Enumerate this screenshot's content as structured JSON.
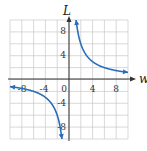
{
  "chart_data": {
    "type": "line",
    "title": "",
    "xlabel": "w",
    "ylabel": "L",
    "xlim": [
      -10,
      10
    ],
    "ylim": [
      -10,
      10
    ],
    "grid": true,
    "grid_step": 2,
    "x_ticks": [
      -8,
      -4,
      0,
      4,
      8
    ],
    "y_ticks": [
      8,
      4,
      -4,
      -8
    ],
    "x_tick_labels": [
      "-8",
      "-4",
      "0",
      "4",
      "8"
    ],
    "y_tick_labels": [
      "8",
      "4",
      "-4",
      "-8"
    ],
    "series": [
      {
        "name": "L = 12/w (w > 0)",
        "x": [
          1.2,
          1.5,
          2,
          3,
          4,
          6,
          8,
          10
        ],
        "y": [
          10,
          8,
          6,
          4,
          3,
          2,
          1.5,
          1.2
        ]
      },
      {
        "name": "L = 12/w (w < 0)",
        "x": [
          -10,
          -8,
          -6,
          -4,
          -3,
          -2,
          -1.5,
          -1.2
        ],
        "y": [
          -1.2,
          -1.5,
          -2,
          -3,
          -4,
          -6,
          -8,
          -10
        ]
      }
    ],
    "curve_color": "#2b6cb8",
    "legend": null
  },
  "labels": {
    "x_axis": "w",
    "y_axis": "L",
    "x_ticks": [
      "-8",
      "-4",
      "0",
      "4",
      "8"
    ],
    "y_ticks": [
      "8",
      "4",
      "-4",
      "-8"
    ]
  }
}
